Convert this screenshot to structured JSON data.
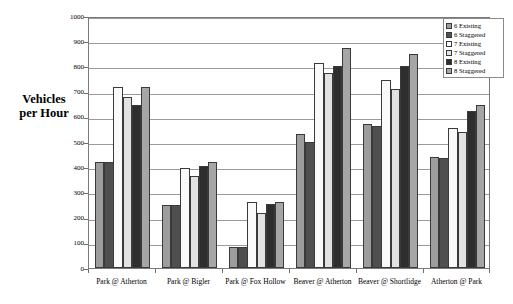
{
  "chart_data": {
    "type": "bar",
    "title": "",
    "subtitle": "",
    "xlabel": "",
    "ylabel": "Vehicles per Hour",
    "ylabel_line1": "Vehicles",
    "ylabel_line2": "per Hour",
    "ylim": [
      0,
      1000
    ],
    "ytick_step": 100,
    "ytick_labels": [
      "1000",
      "900",
      "800",
      "700",
      "600",
      "500",
      "400",
      "300",
      "200",
      "100",
      "0"
    ],
    "ytick_values": [
      1000,
      900,
      800,
      700,
      600,
      500,
      400,
      300,
      200,
      100,
      0
    ],
    "grid": true,
    "grid_axis": "y",
    "legend_position": "top-right",
    "categories": [
      "Park @ Atherton",
      "Park @ Bigler",
      "Park @ Fox Hollow",
      "Beaver @ Atherton",
      "Beaver @ Shortlidge",
      "Atherton @ Park"
    ],
    "series": [
      {
        "name": "6 Existing",
        "color": "#9d9d9d",
        "values": [
          420,
          250,
          85,
          533,
          570,
          440
        ]
      },
      {
        "name": "6 Staggered",
        "color": "#4f4f4f",
        "values": [
          420,
          250,
          82,
          500,
          563,
          435
        ]
      },
      {
        "name": "7 Existing",
        "color": "#fafafa",
        "values": [
          720,
          395,
          260,
          815,
          745,
          555
        ]
      },
      {
        "name": "7 Staggered",
        "color": "#e2e2e2",
        "values": [
          680,
          365,
          220,
          775,
          712,
          540
        ]
      },
      {
        "name": "8 Existing",
        "color": "#2e2e2e",
        "values": [
          645,
          405,
          253,
          800,
          800,
          622
        ]
      },
      {
        "name": "8 Staggered",
        "color": "#a6a6a6",
        "values": [
          720,
          420,
          261,
          873,
          848,
          645
        ]
      }
    ]
  },
  "legend": {
    "entries": [
      {
        "label": "6 Existing"
      },
      {
        "label": "6 Staggered"
      },
      {
        "label": "7 Existing"
      },
      {
        "label": "7 Staggered"
      },
      {
        "label": "8 Existing"
      },
      {
        "label": "8 Staggered"
      }
    ]
  }
}
